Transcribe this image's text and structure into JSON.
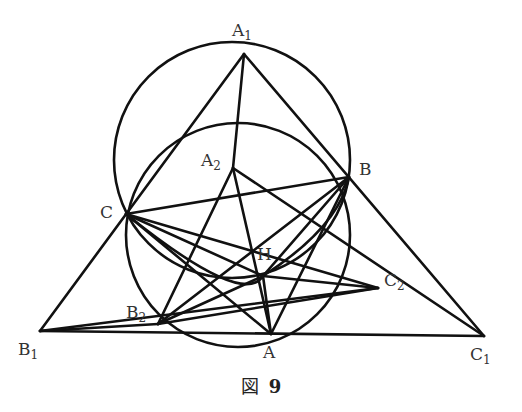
{
  "figure": {
    "caption_prefix": "図",
    "caption_number": "9",
    "stroke_color": "#111111",
    "label_color": "#333333"
  },
  "points": {
    "A1": {
      "label": "A",
      "sub": "1",
      "x": 244,
      "y": 54
    },
    "B": {
      "label": "B",
      "sub": "",
      "x": 349,
      "y": 177
    },
    "C": {
      "label": "C",
      "sub": "",
      "x": 126,
      "y": 214
    },
    "A": {
      "label": "A",
      "sub": "",
      "x": 271,
      "y": 334
    },
    "B1": {
      "label": "B",
      "sub": "1",
      "x": 40,
      "y": 331
    },
    "C1": {
      "label": "C",
      "sub": "1",
      "x": 484,
      "y": 336
    },
    "A2": {
      "label": "A",
      "sub": "2",
      "x": 233,
      "y": 168
    },
    "H": {
      "label": "H",
      "sub": "",
      "x": 263,
      "y": 276
    },
    "B2": {
      "label": "B",
      "sub": "2",
      "x": 158,
      "y": 324
    },
    "C2": {
      "label": "C",
      "sub": "2",
      "x": 378,
      "y": 288
    }
  },
  "segments": [
    [
      "A1",
      "B1"
    ],
    [
      "A1",
      "C1"
    ],
    [
      "B1",
      "C1"
    ],
    [
      "A1",
      "A2"
    ],
    [
      "A2",
      "B2"
    ],
    [
      "A2",
      "A"
    ],
    [
      "A2",
      "C1"
    ],
    [
      "B",
      "C"
    ],
    [
      "B",
      "H"
    ],
    [
      "B",
      "A"
    ],
    [
      "B",
      "B2"
    ],
    [
      "C",
      "H"
    ],
    [
      "C",
      "A"
    ],
    [
      "C",
      "C2"
    ],
    [
      "H",
      "C2"
    ],
    [
      "H",
      "B2"
    ],
    [
      "H",
      "A"
    ],
    [
      "B1",
      "B2"
    ],
    [
      "B2",
      "C2"
    ],
    [
      "B1",
      "C2"
    ]
  ],
  "circles": [
    {
      "name": "circumcircle-A1BC",
      "cx": 232,
      "cy": 160,
      "r": 118
    },
    {
      "name": "circumcircle-ABC",
      "cx": 238,
      "cy": 235,
      "r": 112
    },
    {
      "name": "circumcircle-BHC",
      "cx": 236,
      "cy": 176,
      "r": 110
    }
  ]
}
